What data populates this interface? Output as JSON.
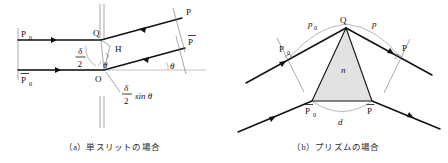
{
  "figure": {
    "panels": [
      {
        "id": "a",
        "caption": "（a）単スリットの場合",
        "labels": {
          "p0_top": "P",
          "p0_top_sub": "0",
          "p0_bottom": "P",
          "p0_bottom_sub": "0",
          "q": "Q",
          "o": "O",
          "h": "H",
          "p_top": "P",
          "p_bottom": "P",
          "theta_right": "θ",
          "theta_inner": "θ",
          "delta_num": "δ",
          "delta_den": "2",
          "path_diff_num": "δ",
          "path_diff_den": "2",
          "path_diff_tail": "sin θ"
        }
      },
      {
        "id": "b",
        "caption": "（b）プリズムの場合",
        "labels": {
          "p0_top": "P",
          "p0_top_sub": "0",
          "p0_bottom": "P",
          "p0_bottom_sub": "0",
          "q": "Q",
          "p_top": "P",
          "p_bottom": "P",
          "p0_path": "p",
          "p0_path_sub": "0",
          "p_path": "p",
          "d_label": "d",
          "n_label": "n"
        }
      }
    ]
  },
  "colors": {
    "ink": "#111111",
    "thin_gray": "#8c8c8c",
    "prism_fill": "#e2e2e2",
    "background": "#ffffff"
  }
}
